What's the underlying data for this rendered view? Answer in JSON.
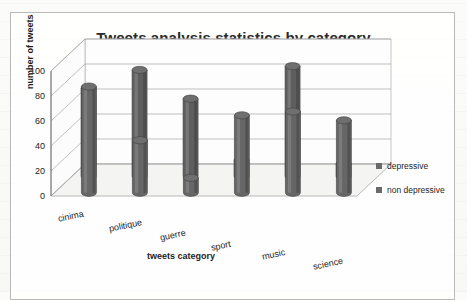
{
  "chart_data": {
    "type": "bar",
    "title": "Tweets analysis statistics by category",
    "xlabel": "tweets category",
    "ylabel": "number of tweets",
    "categories": [
      "cinima",
      "politique",
      "guerre",
      "sport",
      "music",
      "science"
    ],
    "series": [
      {
        "name": "depressive",
        "values": [
          70,
          85,
          62,
          13,
          88,
          10
        ],
        "color": "#5e5e5e"
      },
      {
        "name": "non depressive",
        "values": [
          85,
          42,
          12,
          62,
          65,
          58
        ],
        "color": "#666666"
      }
    ],
    "ylim": [
      0,
      100
    ],
    "yticks": [
      "0",
      "20",
      "40",
      "60",
      "80",
      "100"
    ],
    "grid": true,
    "legend_position": "right",
    "style": "3d-cylinder"
  },
  "frame": {
    "border_color": "#b9b9b9"
  },
  "colors": {
    "text": "#1d1d1d",
    "gridline": "#9a9a9a",
    "floor": "#f2f2f0"
  }
}
